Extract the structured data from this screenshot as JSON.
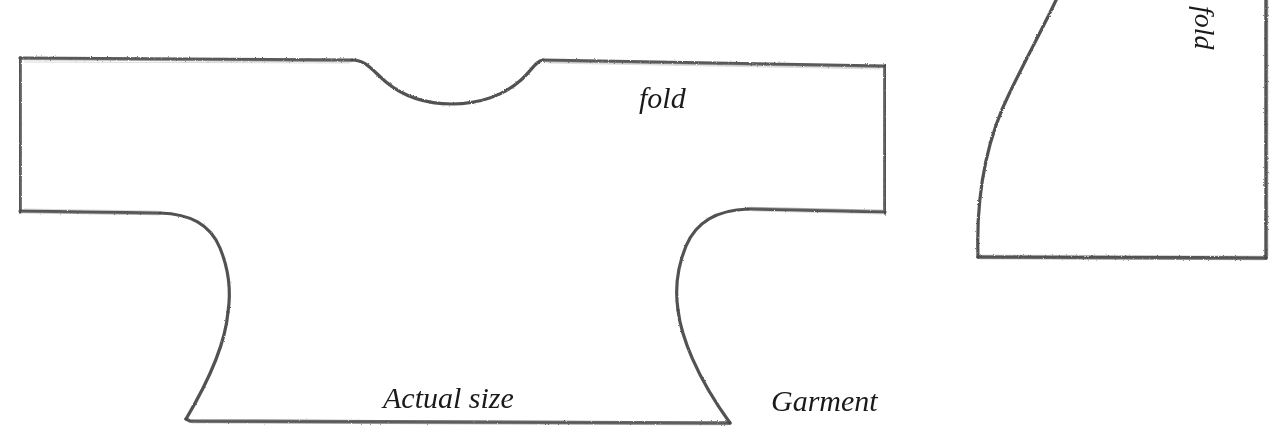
{
  "page": {
    "background_color": "#ffffff",
    "width": 1284,
    "height": 430
  },
  "drawing": {
    "style": "hand-drawn pencil sketch",
    "line_color": "#5a5a5a",
    "line_color_dark": "#3c3c3c",
    "line_width": 3
  },
  "labels": {
    "fold_main": "fold",
    "actual_size": "Actual size",
    "garment": "Garment",
    "fold_right": "fold"
  },
  "pieces": [
    {
      "name": "garment-body",
      "description": "T-shaped tunic pattern half with scooped neckline, wide sleeves and flared body",
      "fold_edge": "top",
      "label": "Garment"
    },
    {
      "name": "quarter-circle-piece",
      "description": "Quarter circle pattern piece with straight bottom edge and straight right fold edge",
      "fold_edge": "right",
      "label": "fold"
    }
  ]
}
